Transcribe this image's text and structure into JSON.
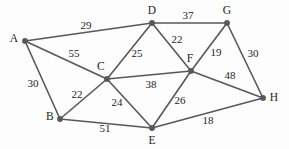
{
  "figure": {
    "kind": "weighted-undirected-graph",
    "background_color": "#fdfdfd",
    "edge_color": "#58585a",
    "node_color": "#58585a",
    "text_color": "#231f20",
    "width": 289,
    "height": 149
  },
  "chart_data": {
    "type": "diagram",
    "title": "",
    "graph_type": "weighted undirected graph",
    "nodes": [
      {
        "id": "A",
        "label": "A",
        "x": 25,
        "y": 41,
        "label_x": 14,
        "label_y": 39
      },
      {
        "id": "B",
        "label": "B",
        "x": 60,
        "y": 119,
        "label_x": 50,
        "label_y": 117
      },
      {
        "id": "C",
        "label": "C",
        "x": 107,
        "y": 79,
        "label_x": 101,
        "label_y": 67
      },
      {
        "id": "D",
        "label": "D",
        "x": 152,
        "y": 23,
        "label_x": 152,
        "label_y": 11
      },
      {
        "id": "E",
        "label": "E",
        "x": 152,
        "y": 128,
        "label_x": 152,
        "label_y": 141
      },
      {
        "id": "F",
        "label": "F",
        "x": 191,
        "y": 71,
        "label_x": 190,
        "label_y": 59
      },
      {
        "id": "G",
        "label": "G",
        "x": 227,
        "y": 23,
        "label_x": 227,
        "label_y": 11
      },
      {
        "id": "H",
        "label": "H",
        "x": 263,
        "y": 98,
        "label_x": 274,
        "label_y": 98
      }
    ],
    "edges": [
      {
        "source": "A",
        "target": "D",
        "weight": 29,
        "label": "29",
        "label_x": 86,
        "label_y": 25
      },
      {
        "source": "A",
        "target": "C",
        "weight": 55,
        "label": "55",
        "label_x": 74,
        "label_y": 53
      },
      {
        "source": "A",
        "target": "B",
        "weight": 30,
        "label": "30",
        "label_x": 33,
        "label_y": 83
      },
      {
        "source": "B",
        "target": "C",
        "weight": 22,
        "label": "22",
        "label_x": 77,
        "label_y": 94
      },
      {
        "source": "B",
        "target": "E",
        "weight": 51,
        "label": "51",
        "label_x": 105,
        "label_y": 128
      },
      {
        "source": "C",
        "target": "D",
        "weight": 25,
        "label": "25",
        "label_x": 137,
        "label_y": 53
      },
      {
        "source": "C",
        "target": "F",
        "weight": 38,
        "label": "38",
        "label_x": 151,
        "label_y": 84
      },
      {
        "source": "C",
        "target": "E",
        "weight": 24,
        "label": "24",
        "label_x": 117,
        "label_y": 102
      },
      {
        "source": "D",
        "target": "G",
        "weight": 37,
        "label": "37",
        "label_x": 188,
        "label_y": 15
      },
      {
        "source": "D",
        "target": "F",
        "weight": 22,
        "label": "22",
        "label_x": 177,
        "label_y": 39
      },
      {
        "source": "F",
        "target": "G",
        "weight": 19,
        "label": "19",
        "label_x": 216,
        "label_y": 52
      },
      {
        "source": "F",
        "target": "H",
        "weight": 48,
        "label": "48",
        "label_x": 230,
        "label_y": 75
      },
      {
        "source": "F",
        "target": "E",
        "weight": 26,
        "label": "26",
        "label_x": 180,
        "label_y": 100
      },
      {
        "source": "G",
        "target": "H",
        "weight": 30,
        "label": "30",
        "label_x": 253,
        "label_y": 53
      },
      {
        "source": "E",
        "target": "H",
        "weight": 18,
        "label": "18",
        "label_x": 208,
        "label_y": 120
      }
    ]
  }
}
